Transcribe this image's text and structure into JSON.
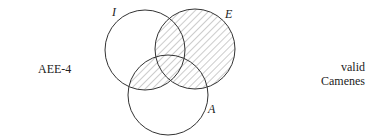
{
  "diagram": {
    "type": "venn",
    "left_label": "AEE-4",
    "right_label_line1": "valid",
    "right_label_line2": "Camenes",
    "circles": [
      {
        "name": "I",
        "label": "I"
      },
      {
        "name": "E",
        "label": "E"
      },
      {
        "name": "A",
        "label": "A"
      }
    ],
    "shaded_regions": [
      "E (entire circle)",
      "I∩A outside E"
    ],
    "stroke_color": "#333333",
    "hatch_color": "#9a9a9a"
  }
}
